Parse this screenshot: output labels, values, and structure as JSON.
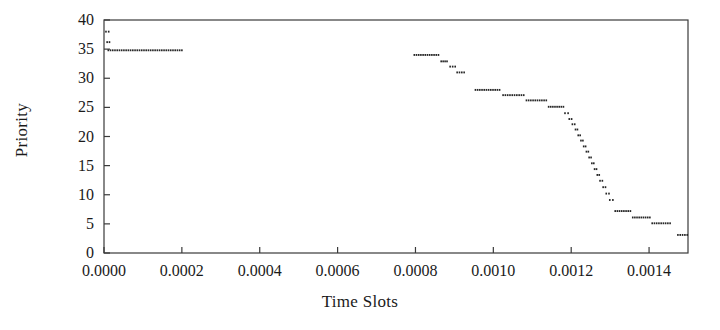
{
  "chart_data": {
    "type": "scatter",
    "title": "",
    "xlabel": "Time Slots",
    "ylabel": "Priority",
    "xlim": [
      0.0,
      0.0015
    ],
    "ylim": [
      0,
      40
    ],
    "grid": false,
    "legend": null,
    "xticks": [
      "0.0000",
      "0.0002",
      "0.0004",
      "0.0006",
      "0.0008",
      "0.0010",
      "0.0012",
      "0.0014"
    ],
    "xtick_values": [
      0.0,
      0.0002,
      0.0004,
      0.0006,
      0.0008,
      0.001,
      0.0012,
      0.0014
    ],
    "yticks": [
      "0",
      "5",
      "10",
      "15",
      "20",
      "25",
      "30",
      "35",
      "40"
    ],
    "ytick_values": [
      0,
      5,
      10,
      15,
      20,
      25,
      30,
      35,
      40
    ],
    "marker": "small horizontal dash",
    "color": "#262626",
    "segments": [
      {
        "y": 38.0,
        "x0": 3e-06,
        "x1": 1e-05
      },
      {
        "y": 36.2,
        "x0": 6e-06,
        "x1": 1.2e-05
      },
      {
        "y": 34.8,
        "x0": 9e-06,
        "x1": 0.000198
      },
      {
        "y": 34.0,
        "x0": 0.000795,
        "x1": 0.000857
      },
      {
        "y": 32.9,
        "x0": 0.000864,
        "x1": 0.000879
      },
      {
        "y": 32.0,
        "x0": 0.000887,
        "x1": 0.0009
      },
      {
        "y": 31.0,
        "x0": 0.000905,
        "x1": 0.000923
      },
      {
        "y": 28.0,
        "x0": 0.000952,
        "x1": 0.001014
      },
      {
        "y": 27.1,
        "x0": 0.001023,
        "x1": 0.001076
      },
      {
        "y": 26.2,
        "x0": 0.001083,
        "x1": 0.001134
      },
      {
        "y": 25.1,
        "x0": 0.00114,
        "x1": 0.001178
      },
      {
        "y": 24.0,
        "x0": 0.001182,
        "x1": 0.00119
      },
      {
        "y": 23.0,
        "x0": 0.001193,
        "x1": 0.001199
      },
      {
        "y": 22.1,
        "x0": 0.001201,
        "x1": 0.001207
      },
      {
        "y": 21.2,
        "x0": 0.001209,
        "x1": 0.001214
      },
      {
        "y": 20.2,
        "x0": 0.001216,
        "x1": 0.001221
      },
      {
        "y": 19.3,
        "x0": 0.001223,
        "x1": 0.001228
      },
      {
        "y": 18.3,
        "x0": 0.00123,
        "x1": 0.001235
      },
      {
        "y": 17.4,
        "x0": 0.001237,
        "x1": 0.001242
      },
      {
        "y": 16.4,
        "x0": 0.001244,
        "x1": 0.001249
      },
      {
        "y": 15.4,
        "x0": 0.001251,
        "x1": 0.001256
      },
      {
        "y": 14.4,
        "x0": 0.001258,
        "x1": 0.001263
      },
      {
        "y": 13.4,
        "x0": 0.001265,
        "x1": 0.00127
      },
      {
        "y": 12.4,
        "x0": 0.001272,
        "x1": 0.001278
      },
      {
        "y": 11.3,
        "x0": 0.00128,
        "x1": 0.001286
      },
      {
        "y": 10.2,
        "x0": 0.001288,
        "x1": 0.001295
      },
      {
        "y": 9.1,
        "x0": 0.001297,
        "x1": 0.001305
      },
      {
        "y": 7.2,
        "x0": 0.001311,
        "x1": 0.00135
      },
      {
        "y": 6.1,
        "x0": 0.001356,
        "x1": 0.0014
      },
      {
        "y": 5.1,
        "x0": 0.001406,
        "x1": 0.001452
      },
      {
        "y": 3.1,
        "x0": 0.001472,
        "x1": 0.001496
      }
    ]
  }
}
